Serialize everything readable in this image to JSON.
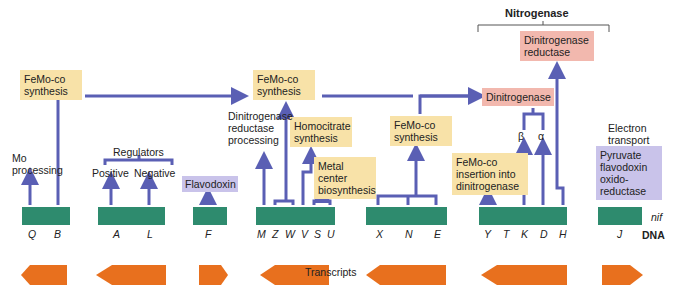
{
  "title": "Nitrogenase",
  "boxes": {
    "femo1": "FeMo-co synthesis",
    "femo2": "FeMo-co synthesis",
    "femo3": "FeMo-co synthesis",
    "homocitrate": "Homocitrate synthesis",
    "metal_center": "Metal center biosynthesis",
    "femo_insertion": "FeMo-co insertion into dinitrogenase",
    "dinitrogenase": "Dinitrogenase",
    "dinitrogenase_reductase": "Dinitrogenase reductase",
    "flavodoxin": "Flavodoxin",
    "pyruvate": "Pyruvate flavodoxin oxido-reductase"
  },
  "labels": {
    "mo_processing": "Mo processing",
    "regulators": "Regulators",
    "positive": "Positive",
    "negative": "Negative",
    "dinitro_processing": "Dinitrogenase reductase processing",
    "beta": "β",
    "alpha": "α",
    "electron_transport": "Electron transport",
    "nif": "nif",
    "dna": "DNA",
    "transcripts": "Transcripts"
  },
  "genes": [
    "Q",
    "B",
    "A",
    "L",
    "F",
    "M",
    "Z",
    "W",
    "V",
    "S",
    "U",
    "X",
    "N",
    "E",
    "Y",
    "T",
    "K",
    "D",
    "H",
    "J"
  ],
  "colors": {
    "gene": "#2e8b6e",
    "transcript": "#e8701e",
    "arrow": "#5a5fb4",
    "yellow": "#f8e2a8",
    "pink": "#f2b8ae",
    "purple": "#c9c3ea"
  }
}
